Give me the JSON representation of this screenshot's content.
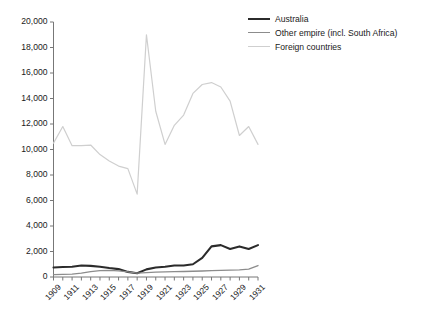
{
  "chart_data": {
    "type": "line",
    "title": "",
    "subtitle": "",
    "xlabel": "",
    "ylabel": "",
    "x": [
      1909,
      1910,
      1911,
      1912,
      1913,
      1914,
      1915,
      1916,
      1917,
      1918,
      1919,
      1920,
      1921,
      1922,
      1923,
      1924,
      1925,
      1926,
      1927,
      1928,
      1929,
      1930,
      1931
    ],
    "xlim": [
      1909,
      1931
    ],
    "ylim": [
      0,
      20000
    ],
    "grid": false,
    "legend_position": "top-right",
    "xtick_labels": [
      "1909",
      "1911",
      "1913",
      "1915",
      "1917",
      "1919",
      "1921",
      "1923",
      "1925",
      "1927",
      "1929",
      "1931"
    ],
    "xtick_values": [
      1909,
      1911,
      1913,
      1915,
      1917,
      1919,
      1921,
      1923,
      1925,
      1927,
      1929,
      1931
    ],
    "ytick_labels": [
      "0",
      "2,000",
      "4,000",
      "6,000",
      "8,000",
      "10,000",
      "12,000",
      "14,000",
      "16,000",
      "18,000",
      "20,000"
    ],
    "ytick_values": [
      0,
      2000,
      4000,
      6000,
      8000,
      10000,
      12000,
      14000,
      16000,
      18000,
      20000
    ],
    "series": [
      {
        "name": "Australia",
        "color": "#2b2b2b",
        "width": 2.1,
        "values": [
          750,
          780,
          800,
          900,
          870,
          800,
          700,
          620,
          400,
          300,
          600,
          750,
          800,
          900,
          900,
          1000,
          1500,
          2400,
          2500,
          2200,
          2400,
          2200,
          2500
        ]
      },
      {
        "name": "Other empire (incl. South Africa)",
        "color": "#8c8c8c",
        "width": 1.3,
        "values": [
          180,
          200,
          220,
          300,
          420,
          500,
          520,
          480,
          400,
          300,
          350,
          380,
          400,
          420,
          430,
          450,
          470,
          500,
          520,
          540,
          560,
          620,
          900
        ]
      },
      {
        "name": "Foreign countries",
        "color": "#cfcfcf",
        "width": 1.2,
        "values": [
          10500,
          11800,
          10300,
          10300,
          10350,
          9600,
          9100,
          8700,
          8500,
          6500,
          19000,
          13000,
          10400,
          11900,
          12700,
          14400,
          15100,
          15250,
          14900,
          13800,
          11100,
          11800,
          10400
        ]
      }
    ]
  },
  "legend": {
    "items": [
      {
        "label": "Australia"
      },
      {
        "label": "Other empire (incl. South Africa)"
      },
      {
        "label": "Foreign countries"
      }
    ]
  }
}
